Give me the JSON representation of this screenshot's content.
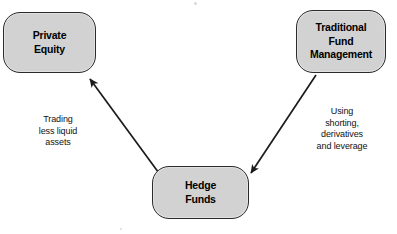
{
  "diagram": {
    "type": "flow-diagram",
    "background_color": "#ffffff",
    "node_fill_color": "#d2d2d2",
    "node_border_color": "#2b2b2b",
    "text_color": "#000000",
    "nodes": [
      {
        "id": "private-equity",
        "label": "Private\nEquity",
        "position": "top-left"
      },
      {
        "id": "traditional-fund",
        "label": "Traditional\nFund\nManagement",
        "position": "top-right"
      },
      {
        "id": "hedge-funds",
        "label": "Hedge\nFunds",
        "position": "bottom-center"
      }
    ],
    "edges": [
      {
        "id": "hedge-to-private-equity",
        "from": "hedge-funds",
        "to": "private-equity",
        "arrowhead": "filled-triangle",
        "label": "Trading\nless liquid\nassets"
      },
      {
        "id": "traditional-to-hedge",
        "from": "traditional-fund",
        "to": "hedge-funds",
        "arrowhead": "filled-triangle",
        "label": "Using\nshorting,\nderivatives\nand leverage"
      }
    ]
  }
}
